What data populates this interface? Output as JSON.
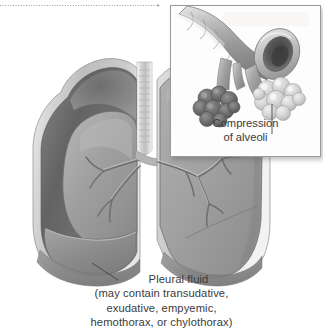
{
  "figure": {
    "background_color": "#ffffff",
    "text_color": "#3b3b3b",
    "width": 323,
    "height": 335
  },
  "main_illustration": {
    "name": "thorax-cross-section",
    "description": "Anterior cutaway view of the thorax showing both lungs, trachea and bronchial tree, with pleural fluid collecting in the left pleural space compressing the lung",
    "parts": [
      {
        "name": "chest-wall",
        "color": "#b8b8b8"
      },
      {
        "name": "pleural-cavity-left",
        "color": "#6e6e6e"
      },
      {
        "name": "compressed-left-lung",
        "color": "#9d9d9d"
      },
      {
        "name": "right-lung",
        "color": "#a3a3a3"
      },
      {
        "name": "trachea",
        "color": "#cfcfcf"
      },
      {
        "name": "bronchial-tree",
        "color": "#8a8a8a"
      },
      {
        "name": "pleural-fluid",
        "color": "#8f8f8f"
      },
      {
        "name": "diaphragm",
        "color": "#909090"
      }
    ]
  },
  "main_label": {
    "leader_line": "leader-line-pleural-fluid",
    "lines": [
      "Pleural fluid",
      "(may contain transudative,",
      "exudative, empyemic,",
      "hemothorax, or chylothorax)"
    ]
  },
  "inset": {
    "name": "alveoli-detail-inset",
    "border_color": "#9a9a9a",
    "background_color": "#fdfdfd",
    "illustration": {
      "name": "bronchiole-and-alveoli",
      "description": "Cut bronchiole opening with a darker collapsed alveolar cluster on the left and a lighter normal alveolar cluster on the right",
      "parts": [
        {
          "name": "bronchus-trunk",
          "color": "#a8a8a8"
        },
        {
          "name": "bronchus-cut-opening",
          "color": "#5e5e5e"
        },
        {
          "name": "compressed-alveoli-cluster",
          "color": "#6f6f6f"
        },
        {
          "name": "normal-alveoli-cluster",
          "color": "#d2d2d2"
        }
      ]
    },
    "label": {
      "leader_line": "leader-line-alveoli",
      "lines": [
        "Compression",
        "of alveoli"
      ]
    }
  },
  "top_rule": {
    "name": "dotted-crop-rule",
    "style": "dotted",
    "color": "#9a9a9a",
    "end_mark": "plus"
  }
}
